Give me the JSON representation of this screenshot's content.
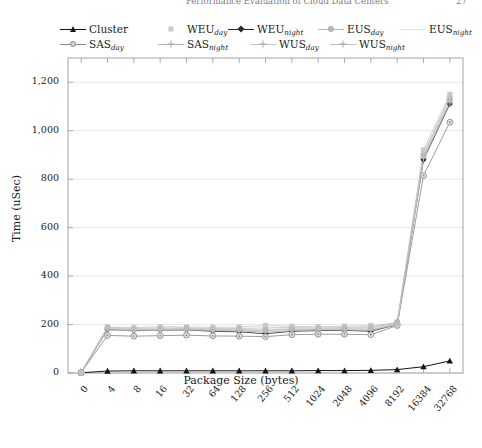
{
  "running_header": {
    "title": "Performance Evaluation of Cloud Data Centers",
    "page": "27"
  },
  "axis_label_x": "Package Size (bytes)",
  "axis_label_y": "Time (uSec)",
  "legend": {
    "row1": [
      {
        "label": "Cluster",
        "sub": "",
        "marker": "triangle",
        "line": true,
        "color": "#141414"
      },
      {
        "label": "WEU",
        "sub": "day",
        "marker": "square",
        "line": false,
        "color": "#c9c9c9"
      },
      {
        "label": "WEU",
        "sub": "night",
        "marker": "diamond",
        "line": true,
        "color": "#2a2a2a"
      },
      {
        "label": "EUS",
        "sub": "day",
        "marker": "dot",
        "line": true,
        "color": "#b4b4b4"
      },
      {
        "label": "EUS",
        "sub": "night",
        "marker": "none",
        "line": true,
        "color": "#e2e2e2"
      }
    ],
    "row2": [
      {
        "label": "SAS",
        "sub": "day",
        "marker": "circle",
        "line": true,
        "color": "#8a8a8a"
      },
      {
        "label": "SAS",
        "sub": "night",
        "marker": "plus",
        "line": true,
        "color": "#b0b0b0"
      },
      {
        "label": "WUS",
        "sub": "day",
        "marker": "plus",
        "line": true,
        "color": "#c4c4c4"
      },
      {
        "label": "WUS",
        "sub": "night",
        "marker": "plus",
        "line": true,
        "color": "#bdbdbd"
      }
    ]
  },
  "chart_data": {
    "type": "line",
    "title": "",
    "xlabel": "Package Size (bytes)",
    "ylabel": "Time (uSec)",
    "categories": [
      "0",
      "4",
      "8",
      "16",
      "32",
      "64",
      "128",
      "256",
      "512",
      "1024",
      "2048",
      "4096",
      "8192",
      "16384",
      "32768"
    ],
    "ylim": [
      0,
      1300
    ],
    "yticks": [
      0,
      200,
      400,
      600,
      800,
      1000,
      1200
    ],
    "ytick_labels": [
      "0",
      "200",
      "400",
      "600",
      "800",
      "1,000",
      "1,200"
    ],
    "grid": true,
    "legend_position": "above-plot",
    "series": [
      {
        "name": "Cluster",
        "color": "#141414",
        "marker": "triangle",
        "values": [
          1,
          8,
          9,
          9,
          9,
          9,
          9,
          9,
          9,
          10,
          10,
          11,
          14,
          26,
          50
        ]
      },
      {
        "name": "WEU_day",
        "color": "#c9c9c9",
        "marker": "square",
        "values": [
          2,
          190,
          188,
          191,
          190,
          189,
          190,
          196,
          193,
          191,
          193,
          196,
          205,
          920,
          1150
        ]
      },
      {
        "name": "WEU_night",
        "color": "#2a2a2a",
        "marker": "diamond",
        "values": [
          2,
          180,
          175,
          176,
          178,
          172,
          170,
          162,
          172,
          175,
          176,
          172,
          200,
          880,
          1110
        ]
      },
      {
        "name": "EUS_day",
        "color": "#b4b4b4",
        "marker": "dot",
        "values": [
          2,
          186,
          180,
          182,
          184,
          180,
          180,
          178,
          182,
          182,
          184,
          186,
          210,
          900,
          1130
        ]
      },
      {
        "name": "EUS_night",
        "color": "#e2e2e2",
        "marker": "none",
        "values": [
          2,
          184,
          182,
          183,
          182,
          180,
          181,
          180,
          183,
          183,
          184,
          185,
          203,
          895,
          1125
        ]
      },
      {
        "name": "SAS_day",
        "color": "#8a8a8a",
        "marker": "circle",
        "values": [
          2,
          155,
          152,
          154,
          156,
          153,
          152,
          150,
          158,
          160,
          160,
          158,
          196,
          815,
          1035
        ]
      },
      {
        "name": "SAS_night",
        "color": "#b0b0b0",
        "marker": "plus",
        "values": [
          2,
          178,
          174,
          176,
          178,
          175,
          174,
          168,
          175,
          178,
          178,
          176,
          200,
          885,
          1115
        ]
      },
      {
        "name": "WUS_day",
        "color": "#c4c4c4",
        "marker": "plus",
        "values": [
          2,
          188,
          184,
          186,
          186,
          184,
          184,
          186,
          188,
          186,
          188,
          190,
          206,
          905,
          1140
        ]
      },
      {
        "name": "WUS_night",
        "color": "#bdbdbd",
        "marker": "plus",
        "values": [
          2,
          182,
          178,
          180,
          181,
          178,
          178,
          174,
          180,
          180,
          182,
          180,
          202,
          890,
          1120
        ]
      }
    ]
  }
}
